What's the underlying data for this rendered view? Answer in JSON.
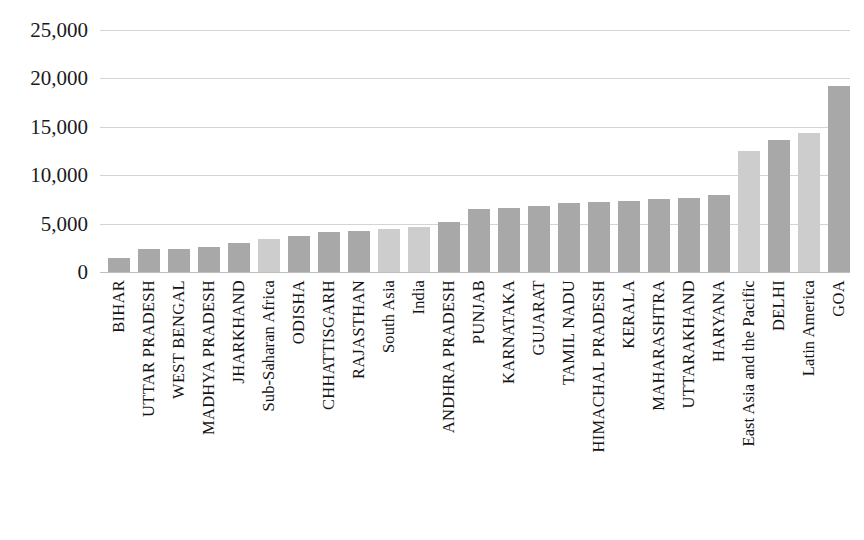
{
  "chart_data": {
    "type": "bar",
    "title": "",
    "subtitle": "",
    "xlabel": "",
    "ylabel": "",
    "ylim": [
      0,
      25000
    ],
    "grid": true,
    "legend_position": "none",
    "y_ticks": [
      "0",
      "5,000",
      "10,000",
      "15,000",
      "20,000",
      "25,000"
    ],
    "y_tick_values": [
      0,
      5000,
      10000,
      15000,
      20000,
      25000
    ],
    "categories": [
      "BIHAR",
      "UTTAR PRADESH",
      "WEST BENGAL",
      "MADHYA PRADESH",
      "JHARKHAND",
      "Sub-Saharan Africa",
      "ODISHA",
      "CHHATTISGARH",
      "RAJASTHAN",
      "South Asia",
      "India",
      "ANDHRA PRADESH",
      "PUNJAB",
      "KARNATAKA",
      "GUJARAT",
      "TAMIL NADU",
      "HIMACHAL PRADESH",
      "KERALA",
      "MAHARASHTRA",
      "UTTARAKHAND",
      "HARYANA",
      "East Asia and the Pacific",
      "DELHI",
      "Latin America",
      "GOA"
    ],
    "values": [
      1400,
      2350,
      2350,
      2600,
      3000,
      3400,
      3750,
      4150,
      4250,
      4450,
      4700,
      5200,
      6500,
      6600,
      6850,
      7100,
      7200,
      7350,
      7500,
      7600,
      7950,
      12500,
      13600,
      14350,
      19200
    ],
    "series_shades": [
      "dark",
      "dark",
      "dark",
      "dark",
      "dark",
      "light",
      "dark",
      "dark",
      "dark",
      "light",
      "light",
      "dark",
      "dark",
      "dark",
      "dark",
      "dark",
      "dark",
      "dark",
      "dark",
      "dark",
      "dark",
      "light",
      "dark",
      "light",
      "dark"
    ],
    "colors": {
      "dark_bar": "#a8a8a8",
      "light_bar": "#cdcdcd",
      "gridline": "#d4d4d4",
      "text": "#1a1a1a",
      "background": "#ffffff"
    }
  }
}
